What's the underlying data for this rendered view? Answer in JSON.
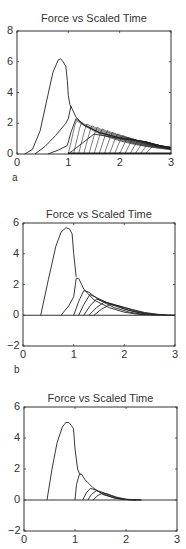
{
  "figure": {
    "panels": [
      {
        "label": "a",
        "title": "Force vs Scaled Time"
      },
      {
        "label": "b",
        "title": "Force vs Scaled Time"
      },
      {
        "label": "c",
        "title": "Force vs Scaled Time"
      }
    ]
  },
  "chart_data": [
    {
      "type": "line",
      "panel": "a",
      "title": "Force vs Scaled Time",
      "xlabel": "",
      "ylabel": "",
      "xlim": [
        0,
        3
      ],
      "ylim": [
        0,
        8
      ],
      "xticks": [
        0,
        1,
        2,
        3
      ],
      "yticks": [
        0,
        2,
        4,
        6,
        8
      ],
      "grid": false,
      "series": [
        {
          "name": "main pulse",
          "x": [
            0.15,
            0.3,
            0.45,
            0.6,
            0.7,
            0.8,
            0.85,
            0.9,
            0.95,
            0.98,
            1.0,
            1.03,
            1.06
          ],
          "y": [
            0,
            0.3,
            1.5,
            3.8,
            5.3,
            6.1,
            6.2,
            6.0,
            5.7,
            4.8,
            3.8,
            3.2,
            3.0
          ]
        },
        {
          "name": "pulse 2",
          "x": [
            0.35,
            0.55,
            0.75,
            0.95,
            1.0,
            1.05,
            1.15,
            1.3,
            1.6,
            2.0,
            2.5,
            2.8,
            3.0
          ],
          "y": [
            0,
            0.5,
            1.2,
            2.0,
            2.3,
            3.1,
            2.4,
            1.9,
            1.4,
            1.05,
            0.8,
            0.5,
            0.3
          ]
        },
        {
          "name": "pulse 3",
          "x": [
            0.6,
            0.8,
            0.98,
            1.05,
            1.15,
            1.3,
            1.6,
            2.0,
            2.5,
            3.0
          ],
          "y": [
            0,
            0.25,
            0.55,
            1.4,
            2.3,
            1.9,
            1.4,
            1.05,
            0.8,
            0.35
          ]
        },
        {
          "name": "pulse train (overlapping)",
          "x": [
            1.0,
            1.5,
            2.0,
            2.5,
            3.0
          ],
          "y": [
            0,
            1.3,
            1.0,
            0.8,
            0.35
          ]
        }
      ]
    },
    {
      "type": "line",
      "panel": "b",
      "title": "Force vs Scaled Time",
      "xlabel": "",
      "ylabel": "",
      "xlim": [
        0,
        3
      ],
      "ylim": [
        -2,
        6
      ],
      "xticks": [
        0,
        1,
        2,
        3
      ],
      "yticks": [
        -2,
        0,
        2,
        4,
        6
      ],
      "grid": false,
      "series": [
        {
          "name": "main pulse",
          "x": [
            0.35,
            0.5,
            0.65,
            0.75,
            0.85,
            0.92,
            0.97,
            1.0,
            1.05
          ],
          "y": [
            0,
            2.3,
            4.5,
            5.4,
            5.7,
            5.6,
            5.3,
            4.0,
            2.5
          ]
        },
        {
          "name": "pulse 2",
          "x": [
            0.75,
            0.9,
            1.0,
            1.05,
            1.1,
            1.2,
            1.4,
            1.7,
            2.0,
            2.3,
            3.0
          ],
          "y": [
            0,
            0.6,
            1.2,
            2.4,
            2.4,
            1.7,
            1.0,
            0.5,
            0.2,
            0.05,
            0
          ]
        },
        {
          "name": "pulse 3",
          "x": [
            1.0,
            1.1,
            1.2,
            1.3,
            1.5,
            1.8,
            2.1,
            2.4
          ],
          "y": [
            0,
            0.9,
            1.6,
            1.5,
            1.0,
            0.5,
            0.2,
            0.05
          ]
        },
        {
          "name": "pulse 4",
          "x": [
            1.1,
            1.2,
            1.32,
            1.45,
            1.7,
            2.0,
            2.3,
            2.6
          ],
          "y": [
            0,
            0.7,
            1.35,
            1.15,
            0.75,
            0.4,
            0.15,
            0.03
          ]
        },
        {
          "name": "pulse 5",
          "x": [
            1.2,
            1.32,
            1.45,
            1.6,
            1.85,
            2.1,
            2.4,
            2.7
          ],
          "y": [
            0,
            0.6,
            1.05,
            0.9,
            0.6,
            0.3,
            0.1,
            0.02
          ]
        },
        {
          "name": "pulse 6",
          "x": [
            1.3,
            1.45,
            1.6,
            1.75,
            2.0,
            2.25,
            2.5,
            2.8
          ],
          "y": [
            0,
            0.5,
            0.85,
            0.75,
            0.5,
            0.25,
            0.08,
            0.01
          ]
        },
        {
          "name": "pulse 7",
          "x": [
            1.4,
            1.55,
            1.72,
            1.9,
            2.15,
            2.4,
            2.7,
            3.0
          ],
          "y": [
            0,
            0.4,
            0.7,
            0.6,
            0.38,
            0.18,
            0.05,
            0
          ]
        }
      ]
    },
    {
      "type": "line",
      "panel": "c",
      "title": "Force vs Scaled Time",
      "xlabel": "",
      "ylabel": "",
      "xlim": [
        0,
        3
      ],
      "ylim": [
        -2,
        6
      ],
      "xticks": [
        0,
        1,
        2,
        3
      ],
      "yticks": [
        -2,
        0,
        2,
        4,
        6
      ],
      "grid": false,
      "series": [
        {
          "name": "main pulse",
          "x": [
            0.45,
            0.55,
            0.65,
            0.75,
            0.82,
            0.88,
            0.93,
            0.97,
            1.0,
            1.05,
            1.1
          ],
          "y": [
            0,
            2.0,
            3.7,
            4.7,
            5.0,
            5.0,
            4.8,
            4.6,
            3.3,
            2.0,
            1.6
          ]
        },
        {
          "name": "pulse 2",
          "x": [
            1.0,
            1.03,
            1.08,
            1.12,
            1.2,
            1.35,
            1.55,
            1.8,
            2.0,
            2.2
          ],
          "y": [
            0,
            1.0,
            1.6,
            1.7,
            1.3,
            0.8,
            0.35,
            0.1,
            0.03,
            0
          ]
        },
        {
          "name": "pulse 3",
          "x": [
            1.15,
            1.22,
            1.3,
            1.4,
            1.55,
            1.75,
            1.95,
            2.2
          ],
          "y": [
            0,
            0.45,
            0.75,
            0.65,
            0.4,
            0.15,
            0.04,
            0
          ]
        },
        {
          "name": "pulse 4",
          "x": [
            1.25,
            1.32,
            1.42,
            1.52,
            1.68,
            1.85,
            2.05,
            2.3
          ],
          "y": [
            0,
            0.35,
            0.6,
            0.52,
            0.3,
            0.1,
            0.02,
            0
          ]
        },
        {
          "name": "pulse 5",
          "x": [
            1.35,
            1.45,
            1.55,
            1.65,
            1.8,
            2.0,
            2.3
          ],
          "y": [
            0,
            0.3,
            0.45,
            0.38,
            0.2,
            0.05,
            0
          ]
        }
      ]
    }
  ]
}
